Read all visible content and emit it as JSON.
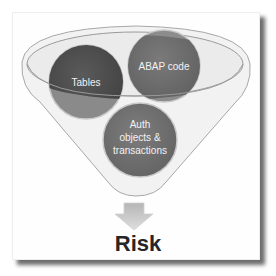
{
  "diagram": {
    "type": "funnel",
    "inputs": [
      {
        "label": "Tables",
        "color": "#4d4d4d"
      },
      {
        "label": "ABAP code",
        "color": "#6e6e6e"
      },
      {
        "label_lines": [
          "Auth",
          "objects &",
          "transactions"
        ],
        "color": "#727272"
      }
    ],
    "output": {
      "label": "Risk",
      "arrow_icon": "down-arrow-icon"
    }
  }
}
